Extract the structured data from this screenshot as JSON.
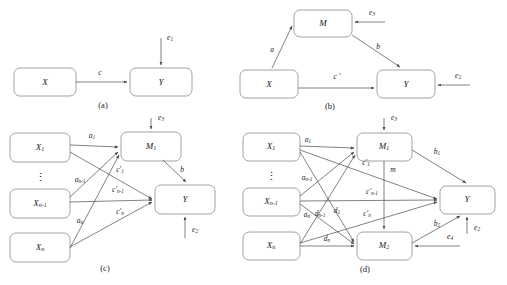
{
  "figure": {
    "colors": {
      "box_stroke": "#8a8a8a",
      "edge_stroke": "#4a4a4a",
      "text": "#1a1a1a",
      "background": "#ffffff"
    },
    "panels": [
      {
        "id": "a",
        "caption": "(a)",
        "nodes": [
          {
            "name": "X",
            "label": "X",
            "sub": ""
          },
          {
            "name": "Y",
            "label": "Y",
            "sub": ""
          }
        ],
        "edges": [
          {
            "from": "X",
            "to": "Y",
            "label": "c",
            "sub": ""
          },
          {
            "from": "error",
            "to": "Y",
            "label": "e",
            "sub": "1"
          }
        ]
      },
      {
        "id": "b",
        "caption": "(b)",
        "nodes": [
          {
            "name": "M",
            "label": "M",
            "sub": ""
          },
          {
            "name": "X",
            "label": "X",
            "sub": ""
          },
          {
            "name": "Y",
            "label": "Y",
            "sub": ""
          }
        ],
        "edges": [
          {
            "from": "X",
            "to": "M",
            "label": "a",
            "sub": ""
          },
          {
            "from": "M",
            "to": "Y",
            "label": "b",
            "sub": ""
          },
          {
            "from": "X",
            "to": "Y",
            "label": "c '",
            "sub": ""
          },
          {
            "from": "error",
            "to": "M",
            "label": "e",
            "sub": "3"
          },
          {
            "from": "error",
            "to": "Y",
            "label": "e",
            "sub": "2"
          }
        ]
      },
      {
        "id": "c",
        "caption": "(c)",
        "nodes": [
          {
            "name": "X1",
            "label": "X",
            "sub": "1"
          },
          {
            "name": "dots",
            "label": "⋮",
            "sub": ""
          },
          {
            "name": "Xn1",
            "label": "X",
            "sub": "n-1"
          },
          {
            "name": "Xn",
            "label": "X",
            "sub": "n"
          },
          {
            "name": "M1",
            "label": "M",
            "sub": "1"
          },
          {
            "name": "Y",
            "label": "Y",
            "sub": ""
          }
        ],
        "edges": [
          {
            "from": "X1",
            "to": "M1",
            "label": "a",
            "sub": "1"
          },
          {
            "from": "Xn1",
            "to": "M1",
            "label": "a",
            "sub": "n-1"
          },
          {
            "from": "Xn",
            "to": "M1",
            "label": "a",
            "sub": "n"
          },
          {
            "from": "X1",
            "to": "Y",
            "label": "c'",
            "sub": "1"
          },
          {
            "from": "Xn1",
            "to": "Y",
            "label": "c'",
            "sub": "n-1"
          },
          {
            "from": "Xn",
            "to": "Y",
            "label": "c'",
            "sub": "n"
          },
          {
            "from": "M1",
            "to": "Y",
            "label": "b",
            "sub": ""
          },
          {
            "from": "error",
            "to": "M1",
            "label": "e",
            "sub": "3"
          },
          {
            "from": "error",
            "to": "Y",
            "label": "e",
            "sub": "2"
          }
        ]
      },
      {
        "id": "d",
        "caption": "(d)",
        "nodes": [
          {
            "name": "X1",
            "label": "X",
            "sub": "1"
          },
          {
            "name": "dots",
            "label": "⋮",
            "sub": ""
          },
          {
            "name": "Xn1",
            "label": "X",
            "sub": "n-1"
          },
          {
            "name": "Xn",
            "label": "X",
            "sub": "n"
          },
          {
            "name": "M1",
            "label": "M",
            "sub": "1"
          },
          {
            "name": "M2",
            "label": "M",
            "sub": "2"
          },
          {
            "name": "Y",
            "label": "Y",
            "sub": ""
          }
        ],
        "edges": [
          {
            "from": "X1",
            "to": "M1",
            "label": "a",
            "sub": "1"
          },
          {
            "from": "Xn1",
            "to": "M1",
            "label": "a",
            "sub": "n-1"
          },
          {
            "from": "Xn",
            "to": "M1",
            "label": "a",
            "sub": "n"
          },
          {
            "from": "X1",
            "to": "M2",
            "label": "d",
            "sub": "1"
          },
          {
            "from": "Xn1",
            "to": "M2",
            "label": "d",
            "sub": "n-1"
          },
          {
            "from": "Xn",
            "to": "M2",
            "label": "d",
            "sub": "n"
          },
          {
            "from": "X1",
            "to": "Y",
            "label": "c'",
            "sub": "1"
          },
          {
            "from": "Xn1",
            "to": "Y",
            "label": "c'",
            "sub": "n-1"
          },
          {
            "from": "Xn",
            "to": "Y",
            "label": "c'",
            "sub": "n"
          },
          {
            "from": "M1",
            "to": "Y",
            "label": "b",
            "sub": "1"
          },
          {
            "from": "M2",
            "to": "Y",
            "label": "b",
            "sub": "2"
          },
          {
            "from": "M1",
            "to": "M2",
            "label": "m",
            "sub": ""
          },
          {
            "from": "error",
            "to": "M1",
            "label": "e",
            "sub": "3"
          },
          {
            "from": "error",
            "to": "M2",
            "label": "e",
            "sub": "4"
          },
          {
            "from": "error",
            "to": "Y",
            "label": "e",
            "sub": "2"
          }
        ]
      }
    ]
  }
}
